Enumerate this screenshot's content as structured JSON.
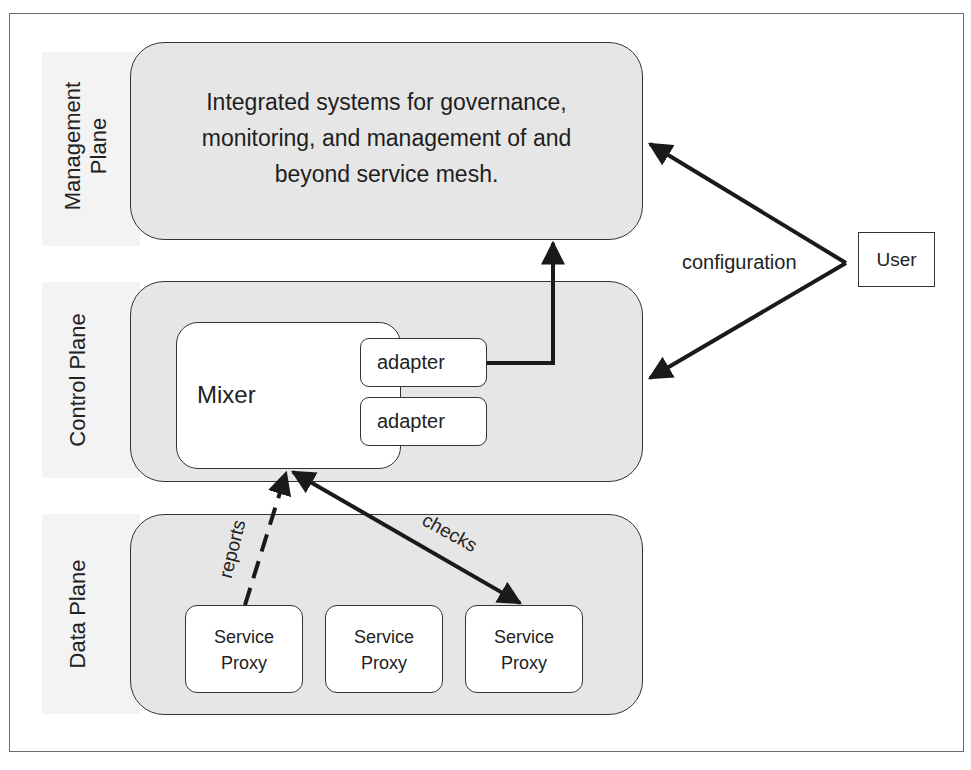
{
  "diagram": {
    "layers": [
      {
        "id": "management",
        "label": "Management\nPlane",
        "label_lines": [
          "Management",
          "Plane"
        ],
        "description_lines": [
          "Integrated systems for governance,",
          "monitoring, and management of and",
          "beyond service mesh."
        ]
      },
      {
        "id": "control",
        "label": "Control Plane"
      },
      {
        "id": "data",
        "label": "Data Plane"
      }
    ],
    "control_plane": {
      "mixer_label": "Mixer",
      "adapters": [
        "adapter",
        "adapter"
      ]
    },
    "data_plane": {
      "proxies": [
        {
          "line1": "Service",
          "line2": "Proxy"
        },
        {
          "line1": "Service",
          "line2": "Proxy"
        },
        {
          "line1": "Service",
          "line2": "Proxy"
        }
      ]
    },
    "external": {
      "user_label": "User"
    },
    "edges": {
      "configuration": "configuration",
      "reports": "reports",
      "checks": "checks"
    },
    "colors": {
      "plane_fill": "#e6e6e6",
      "box_fill": "#ffffff",
      "stroke": "#333333",
      "arrow": "#1a1a1a",
      "label_strip": "#f3f3f3"
    }
  }
}
